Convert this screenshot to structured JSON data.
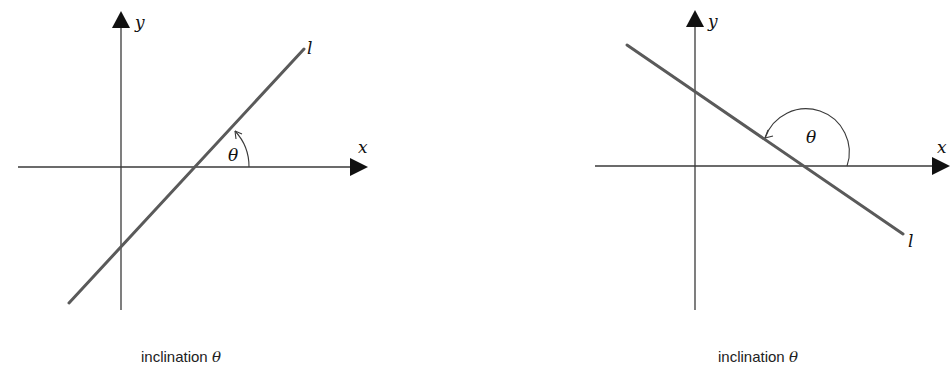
{
  "figures": [
    {
      "id": "positive-slope",
      "labels": {
        "x_axis": "x",
        "y_axis": "y",
        "line": "l",
        "angle": "θ",
        "caption": "inclination ",
        "caption_symbol": "θ"
      },
      "description": "Line l with positive slope; inclination θ is an acute angle measured counterclockwise from the positive x-axis"
    },
    {
      "id": "negative-slope",
      "labels": {
        "x_axis": "x",
        "y_axis": "y",
        "line": "l",
        "angle": "θ",
        "caption": "inclination ",
        "caption_symbol": "θ"
      },
      "description": "Line l with negative slope; inclination θ is an obtuse angle measured counterclockwise from the positive x-axis"
    }
  ],
  "colors": {
    "axis": "#3a3a3a",
    "line": "#5a5a5a",
    "background": "#ffffff"
  }
}
